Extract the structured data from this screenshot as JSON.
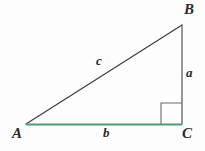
{
  "figure": {
    "background_color": "#fdfdfd",
    "width": 205,
    "height": 151,
    "vertices": [
      {
        "name": "A",
        "label": "A",
        "x": 26,
        "y": 124
      },
      {
        "name": "B",
        "label": "B",
        "x": 182,
        "y": 25
      },
      {
        "name": "C",
        "label": "C",
        "x": 182,
        "y": 124
      }
    ],
    "sides": [
      {
        "name": "hypotenuse",
        "label": "c",
        "from": "A",
        "to": "B",
        "color": "#3b3b46",
        "width": 1.2
      },
      {
        "name": "opposite-leg",
        "label": "a",
        "from": "B",
        "to": "C",
        "color": "#6a6a72",
        "width": 1.4
      },
      {
        "name": "adjacent-leg",
        "label": "b",
        "from": "A",
        "to": "C",
        "color": "#4e9c6f",
        "width": 1.8
      }
    ],
    "right_angle_marker": {
      "name": "right-angle-square",
      "at_vertex": "C",
      "size": 21,
      "color": "#6a6a72",
      "x": 161,
      "y": 103
    },
    "labels": {
      "A": "A",
      "B": "B",
      "C": "C",
      "a": "a",
      "b": "b",
      "c": "c"
    }
  }
}
